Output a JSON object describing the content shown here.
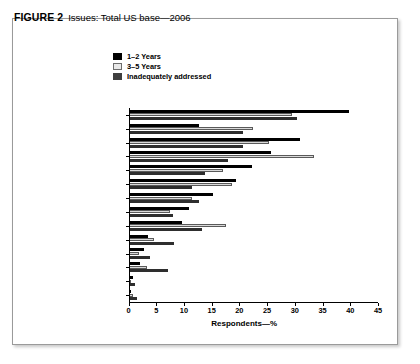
{
  "figure": {
    "number_label": "FIGURE 2",
    "title": "Issues: Total US base—2006"
  },
  "legend": {
    "position": "top-center",
    "items": [
      {
        "label": "1–2 Years",
        "swatch": "black",
        "color": "#000000"
      },
      {
        "label": "3–5 Years",
        "swatch": "light",
        "color": "#d9d9d9"
      },
      {
        "label": "Inadequately addressed",
        "swatch": "dark",
        "color": "#2e2e2e"
      }
    ]
  },
  "chart_data": {
    "type": "bar",
    "orientation": "horizontal",
    "title": "Issues: Total US base—2006",
    "xlabel": "Respondents—%",
    "ylabel": "",
    "xlim": [
      0,
      45
    ],
    "xticks": [
      0,
      5,
      10,
      15,
      20,
      25,
      30,
      35,
      40,
      45
    ],
    "grid": false,
    "legend_position": "top-center",
    "categories": [
      "Regulatory",
      "Business Factors",
      "Source Water",
      "Infrastructure",
      "Security",
      "Water Treatment",
      "Workforce",
      "Macro Factors",
      "Consumers",
      "Drinking Water Quality",
      "Industry Leadership",
      "Technology",
      "Energy",
      "Wastewater"
    ],
    "series": [
      {
        "name": "1–2 Years",
        "color": "#000000",
        "values": [
          39.8,
          12.7,
          30.9,
          25.7,
          22.3,
          19.3,
          15.3,
          11.0,
          9.7,
          3.5,
          2.8,
          2.0,
          0.9,
          0.5
        ]
      },
      {
        "name": "3–5 Years",
        "color": "#d9d9d9",
        "values": [
          29.5,
          22.5,
          25.3,
          33.5,
          17.0,
          18.7,
          11.5,
          7.5,
          17.5,
          4.6,
          1.9,
          3.4,
          0.5,
          0.9
        ]
      },
      {
        "name": "Inadequately addressed",
        "color": "#2e2e2e",
        "values": [
          30.4,
          20.7,
          20.7,
          18.0,
          13.8,
          11.5,
          12.8,
          8.0,
          13.3,
          8.2,
          3.9,
          7.2,
          1.1,
          1.6
        ]
      }
    ]
  }
}
